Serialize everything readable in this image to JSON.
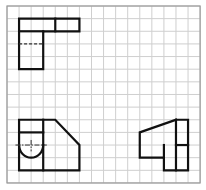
{
  "diagram": {
    "type": "orthographic-projection-views-on-grid",
    "grid": {
      "columns": 16,
      "rows": 14,
      "origin_px": [
        7,
        6
      ],
      "cell_w_px": 12.07,
      "cell_h_px": 12.64,
      "line_color": "#cfcfcf",
      "frame_color": "#9a9a9a"
    },
    "line_color": "#111111",
    "views": [
      {
        "name": "top-view",
        "position": "top-left",
        "outline": [
          [
            1,
            1
          ],
          [
            6,
            1
          ],
          [
            6,
            2
          ],
          [
            3,
            2
          ],
          [
            3,
            5
          ],
          [
            1,
            5
          ],
          [
            1,
            1
          ]
        ],
        "segments": [
          [
            [
              1,
              2
            ],
            [
              3,
              2
            ]
          ],
          [
            [
              4,
              1
            ],
            [
              4,
              2
            ]
          ]
        ],
        "hidden_lines": [
          [
            [
              1,
              3
            ],
            [
              3,
              3
            ]
          ]
        ]
      },
      {
        "name": "front-view",
        "position": "bottom-left",
        "outline": [
          [
            1,
            9
          ],
          [
            4,
            9
          ],
          [
            6,
            11
          ],
          [
            6,
            13
          ],
          [
            1,
            13
          ],
          [
            1,
            9
          ]
        ],
        "segments": [
          [
            [
              3,
              9
            ],
            [
              3,
              13
            ]
          ],
          [
            [
              1,
              10
            ],
            [
              3,
              10
            ]
          ]
        ],
        "arcs": [
          {
            "center": [
              2,
              11
            ],
            "radius_cells": 1,
            "half": "lower"
          }
        ],
        "center_lines": [
          [
            [
              0.7,
              11
            ],
            [
              3.3,
              11
            ]
          ],
          [
            [
              2,
              10.6
            ],
            [
              2,
              11.5
            ]
          ]
        ]
      },
      {
        "name": "side-view",
        "position": "bottom-right",
        "outline": [
          [
            14,
            9
          ],
          [
            15,
            9
          ],
          [
            15,
            13
          ],
          [
            13,
            13
          ],
          [
            13,
            12
          ],
          [
            11,
            12
          ],
          [
            11,
            10
          ],
          [
            14,
            9
          ]
        ],
        "segments": [
          [
            [
              14,
              9
            ],
            [
              14,
              13
            ]
          ],
          [
            [
              14,
              11
            ],
            [
              15,
              11
            ]
          ],
          [
            [
              13,
              11
            ],
            [
              13,
              12
            ]
          ]
        ]
      }
    ]
  }
}
